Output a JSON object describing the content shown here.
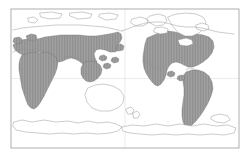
{
  "figure": {
    "projection": "equirectangular, Pacific-centred",
    "background_color": "#ffffff",
    "frame": {
      "x": 11,
      "y": 9,
      "width": 228,
      "height": 139,
      "stroke_color": "#9b9b9b"
    }
  },
  "legend": {
    "shaded_meaning": "distribution range present",
    "unshaded_meaning": "absent",
    "shaded_fill_color": "#9e9e9e",
    "shaded_hatch_color": "#7d7d7d",
    "coastline_color": "#8c8c8c"
  },
  "regions": {
    "shaded": [
      "Africa",
      "Europe",
      "Asia south of approximately 65 degrees North",
      "Indonesia",
      "North America south of the Arctic",
      "Central America",
      "South America"
    ],
    "unshaded": [
      "Greenland",
      "Canadian Arctic archipelago",
      "northern Siberia",
      "northern Scandinavia",
      "Australia",
      "New Zealand",
      "Antarctica"
    ]
  },
  "geometry": {
    "graticule": [
      "M11 78.5 L239 78.5",
      "M125 9 L125 148"
    ],
    "coastlines_unshaded": [
      "M168 17 L176 14 L186 13 L196 14 L203 17 L206 22 L204 28 L199 33 L192 36 L185 36 L179 33 L174 28 L170 22 Z",
      "M150 16 L158 14 L165 16 L167 21 L163 25 L156 26 L150 23 L147 19 Z",
      "M132 19 L140 17 L147 19 L148 23 L143 26 L136 26 L131 23 Z",
      "M155 28 L162 27 L168 29 L167 33 L160 34 L154 32 Z",
      "M178 40 L186 38 L192 40 L193 44 L187 46 L180 45 Z",
      "M196 25 L202 23 L208 25 L209 29 L203 31 L197 29 Z",
      "M88 88 L95 85 L104 84 L113 86 L120 90 L124 96 L123 103 L118 108 L110 111 L100 111 L92 108 L87 102 L85 95 Z",
      "M126 109 L131 107 L134 110 L132 114 L128 114 Z",
      "M133 113 L137 111 L140 114 L138 118 L134 118 Z",
      "M40 13 L52 12 L62 14 L60 18 L50 19 L41 17 Z",
      "M70 13 L82 12 L92 14 L90 18 L78 19 L70 16 Z",
      "M100 14 L110 13 L118 15 L116 19 L106 20 L99 17 Z",
      "M28 18 L34 17 L38 20 L35 23 L29 22 Z",
      "M14 122 L22 120 L32 122 L44 120 L56 122 L68 121 L78 123 L88 121 L98 123 L108 122 L116 124 L122 127 L118 131 L110 133 L98 134 L86 133 L74 134 L62 133 L50 134 L38 133 L26 132 L16 130 L13 126 Z",
      "M122 127 L132 125 L144 126 L156 124 L168 126 L180 124 L192 126 L204 124 L216 126 L228 125 L236 128 L234 133 L224 135 L212 134 L200 135 L188 134 L176 135 L164 134 L152 135 L140 134 L130 133 L123 131 Z",
      "M212 116 L220 114 L228 116 L230 120 L224 123 L216 122 L211 119 Z"
    ],
    "range_shaded": [
      "M13 44 L18 41 L24 40 L30 42 L36 40 L44 38 L54 36 L64 35 L74 35 L84 36 L94 36 L102 35 L110 34 L116 33 L120 31 L124 32 L126 36 L124 41 L121 45 L124 47 L130 46 L136 44 L142 41 L148 38 L154 34 L160 31 L166 30 L172 31 L178 33 L184 34 L190 33 L196 33 L202 34 L208 36 L212 39 L214 44 L212 50 L208 55 L204 60 L200 64 L196 67 L192 69 L188 68 L184 66 L180 64 L176 63 L172 64 L168 66 L164 68 L160 69 L156 68 L152 66 L148 64 L144 63 L140 64 L138 68 L140 72 L144 75 L148 78 L152 82 L156 87 L160 93 L164 99 L168 105 L171 111 L173 117 L174 123 L172 128 L168 130 L164 128 L160 124 L156 118 L152 111 L148 104 L144 97 L140 91 L136 86 L132 82 L128 79 L124 77 L120 76 L116 76 L112 77 L108 79 L104 82 L100 86 L96 91 L92 96 L88 101 L84 105 L80 108 L76 110 L72 110 L68 108 L64 105 L60 101 L56 96 L52 91 L48 86 L44 81 L40 76 L36 71 L32 66 L28 61 L24 56 L20 51 L16 47 Z"
    ],
    "range_eurasia": "M13 45 L17 42 L22 40 L27 39 L32 41 L38 39 L45 37 L53 36 L61 35 L70 35 L79 35 L88 36 L96 36 L103 35 L109 34 L114 33 L118 32 L121 34 L122 38 L120 42 L118 45 L120 47 L119 50 L115 52 L110 52 L105 50 L100 49 L96 50 L94 54 L95 58 L97 62 L96 66 L92 68 L87 67 L83 64 L79 61 L75 59 L71 58 L67 59 L63 61 L59 62 L55 61 L51 58 L47 55 L43 53 L39 52 L35 53 L31 55 L27 56 L23 55 L19 53 L15 50 Z",
    "range_africa": "M22 55 L28 53 L34 52 L40 53 L46 52 L52 54 L56 57 L58 62 L57 68 L55 74 L52 80 L49 86 L46 92 L43 98 L40 103 L37 107 L34 109 L31 108 L28 105 L26 100 L24 94 L22 88 L21 82 L20 76 L19 70 L19 64 L20 59 Z",
    "range_seasia": "M84 62 L90 61 L96 62 L100 65 L102 69 L101 74 L98 78 L94 81 L90 82 L86 81 L83 78 L81 74 L81 68 Z",
    "range_northamerica": "M147 38 L154 35 L161 32 L168 31 L175 32 L182 34 L189 34 L196 34 L203 35 L209 37 L213 41 L214 47 L212 53 L208 58 L203 62 L198 65 L193 67 L188 67 L184 65 L180 63 L176 62 L172 63 L169 66 L167 70 L166 75 L164 80 L161 84 L158 86 L155 85 L152 82 L149 78 L146 73 L144 68 L143 62 L143 56 L144 50 L145 44 Z",
    "range_southamerica": "M186 72 L192 70 L198 70 L204 72 L209 76 L212 82 L213 89 L211 96 L208 103 L204 110 L200 116 L196 121 L192 125 L188 127 L185 126 L183 122 L182 116 L182 109 L183 102 L184 95 L184 88 L183 82 L183 76 Z",
    "range_islands": [
      "M104 64 L108 63 L111 65 L110 68 L106 69 L103 67 Z",
      "M112 58 L116 57 L119 59 L118 62 L114 63 L111 61 Z",
      "M100 56 L104 55 L107 57 L106 60 L102 61 L99 59 Z",
      "M117 45 L121 44 L124 46 L123 50 L119 51 L116 49 Z",
      "M26 36 L31 34 L36 35 L37 39 L33 41 L28 40 Z",
      "M14 38 L19 37 L22 39 L21 43 L17 44 L13 42 Z",
      "M168 72 L172 71 L175 73 L174 76 L170 77 L167 75 Z",
      "M178 76 L182 75 L185 77 L184 80 L180 81 L177 79 Z"
    ],
    "coast_detail_lines": [
      "M13 30 L22 28 L32 27 L44 26 L56 25 L68 25 L80 25 L92 26 L104 27 L114 29 L122 31",
      "M122 31 L130 28 L138 25 L146 23 L154 22 L162 22 L170 24 L178 26 L186 27 L194 27 L202 28 L210 30 L218 32 L226 33 L234 34",
      "M13 52 L18 50 L24 49 L30 50 L36 49 L42 50",
      "M62 58 L68 56 L74 57 L80 59 L84 62",
      "M143 60 L148 63 L153 67 L158 70",
      "M186 70 L190 68 L194 69 L198 71"
    ]
  }
}
